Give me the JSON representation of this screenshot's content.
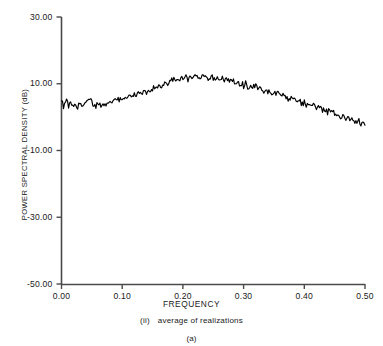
{
  "chart_data": {
    "type": "line",
    "title": "",
    "xlabel": "FREQUENCY",
    "ylabel": "POWER SPECTRAL DENSITY (dB)",
    "xlim": [
      0.0,
      0.5
    ],
    "ylim": [
      -50.0,
      30.0
    ],
    "xticks": [
      0.0,
      0.1,
      0.2,
      0.3,
      0.4,
      0.5
    ],
    "xtick_labels": [
      "0.00",
      "0.10",
      "0.20",
      "0.30",
      "0.40",
      "0.50"
    ],
    "yticks": [
      30.0,
      10.0,
      -10.0,
      -30.0,
      -50.0
    ],
    "ytick_labels": [
      "30.00",
      "10.00",
      "-10.00",
      "-30.00",
      "-50.00"
    ],
    "grid": false,
    "legend": "none",
    "line_color": "#000000",
    "series": [
      {
        "name": "average of realizations",
        "x": [
          0.0,
          0.004,
          0.008,
          0.012,
          0.016,
          0.02,
          0.024,
          0.028,
          0.032,
          0.036,
          0.04,
          0.044,
          0.048,
          0.052,
          0.056,
          0.06,
          0.064,
          0.068,
          0.072,
          0.076,
          0.08,
          0.084,
          0.088,
          0.092,
          0.096,
          0.1,
          0.104,
          0.108,
          0.112,
          0.116,
          0.12,
          0.124,
          0.128,
          0.132,
          0.136,
          0.14,
          0.144,
          0.148,
          0.152,
          0.156,
          0.16,
          0.164,
          0.168,
          0.172,
          0.176,
          0.18,
          0.184,
          0.188,
          0.192,
          0.196,
          0.2,
          0.204,
          0.208,
          0.212,
          0.216,
          0.22,
          0.224,
          0.228,
          0.232,
          0.236,
          0.24,
          0.244,
          0.248,
          0.252,
          0.256,
          0.26,
          0.264,
          0.268,
          0.272,
          0.276,
          0.28,
          0.284,
          0.288,
          0.292,
          0.296,
          0.3,
          0.304,
          0.308,
          0.312,
          0.316,
          0.32,
          0.324,
          0.328,
          0.332,
          0.336,
          0.34,
          0.344,
          0.348,
          0.352,
          0.356,
          0.36,
          0.364,
          0.368,
          0.372,
          0.376,
          0.38,
          0.384,
          0.388,
          0.392,
          0.396,
          0.4,
          0.404,
          0.408,
          0.412,
          0.416,
          0.42,
          0.424,
          0.428,
          0.432,
          0.436,
          0.44,
          0.444,
          0.448,
          0.452,
          0.456,
          0.46,
          0.464,
          0.468,
          0.472,
          0.476,
          0.48,
          0.484,
          0.488,
          0.492,
          0.496,
          0.5
        ],
        "y": [
          4.3,
          3.3,
          5.2,
          3.6,
          4.6,
          3.3,
          4.1,
          3.0,
          3.8,
          3.1,
          4.4,
          5.5,
          4.9,
          4.2,
          3.4,
          4.3,
          3.2,
          4.2,
          3.6,
          4.6,
          4.1,
          5.0,
          4.6,
          5.4,
          5.2,
          6.0,
          5.7,
          6.4,
          6.0,
          6.8,
          6.5,
          7.2,
          7.5,
          7.1,
          8.0,
          7.7,
          8.5,
          8.2,
          9.1,
          8.7,
          9.4,
          9.1,
          9.8,
          10.5,
          9.9,
          10.7,
          11.5,
          10.6,
          11.3,
          10.8,
          11.6,
          12.3,
          11.4,
          12.1,
          12.6,
          11.8,
          12.4,
          11.6,
          12.2,
          11.5,
          12.0,
          11.3,
          11.9,
          11.2,
          11.8,
          11.0,
          11.6,
          10.8,
          11.9,
          10.5,
          11.0,
          10.2,
          10.7,
          9.8,
          10.3,
          9.5,
          9.9,
          9.1,
          9.6,
          8.8,
          9.2,
          8.3,
          8.9,
          8.0,
          8.5,
          7.5,
          8.0,
          7.0,
          7.6,
          6.6,
          7.1,
          6.1,
          6.6,
          5.6,
          6.0,
          5.0,
          5.5,
          4.5,
          5.0,
          4.0,
          4.4,
          3.5,
          3.9,
          3.0,
          3.4,
          2.5,
          2.9,
          2.0,
          2.4,
          1.5,
          1.9,
          1.0,
          1.4,
          0.5,
          0.9,
          0.0,
          0.4,
          -0.5,
          -0.1,
          -1.0,
          -0.6,
          -1.4,
          -1.0,
          -1.8,
          -1.3,
          -2.0
        ]
      }
    ]
  },
  "caption": {
    "roman_numeral": "(ii)",
    "subtitle": "average of realizations",
    "figure_label": "(a)"
  }
}
